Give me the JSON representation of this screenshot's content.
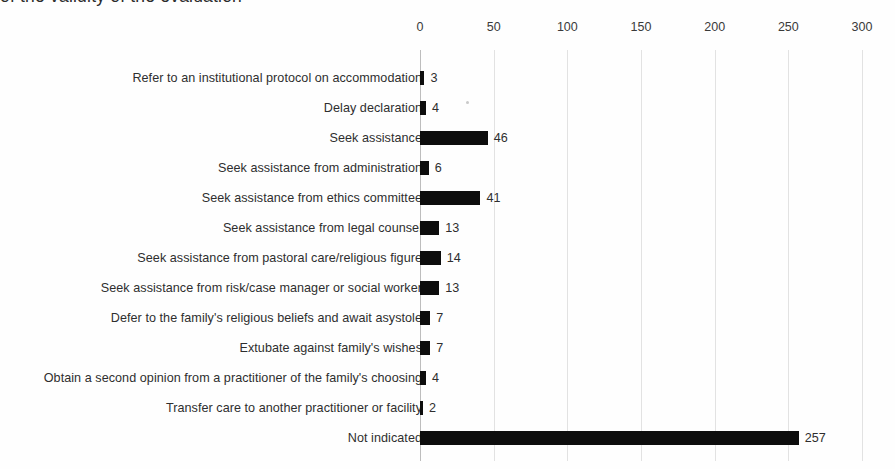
{
  "document": {
    "clipped_top_line": "of the validity of the evaluation"
  },
  "chart_data": {
    "type": "bar",
    "orientation": "horizontal",
    "title": "",
    "subtitle": "",
    "xlabel": "",
    "ylabel": "",
    "xlim": [
      0,
      300
    ],
    "xticks": [
      0,
      50,
      100,
      150,
      200,
      250,
      300
    ],
    "xtick_labels": [
      "0",
      "50",
      "100",
      "150",
      "200",
      "250",
      "300"
    ],
    "grid": true,
    "legend": false,
    "bar_color": "#0d0d0d",
    "gridline_color": "#e2e2e2",
    "categories": [
      "Refer to an institutional protocol on accommodation",
      "Delay declaration",
      "Seek assistance",
      "Seek assistance from administration",
      "Seek assistance from ethics committee",
      "Seek assistance from legal counsel",
      "Seek assistance from pastoral care/religious figure",
      "Seek assistance from risk/case manager or social worker",
      "Defer to the family's religious beliefs and await asystole",
      "Extubate against family's wishes",
      "Obtain a second opinion from a practitioner of the family's choosing",
      "Transfer care to another practitioner or facility",
      "Not indicated"
    ],
    "values": [
      3,
      4,
      46,
      6,
      41,
      13,
      14,
      13,
      7,
      7,
      4,
      2,
      257
    ],
    "value_labels": [
      "3",
      "4",
      "46",
      "6",
      "41",
      "13",
      "14",
      "13",
      "7",
      "7",
      "4",
      "2",
      "257"
    ]
  }
}
